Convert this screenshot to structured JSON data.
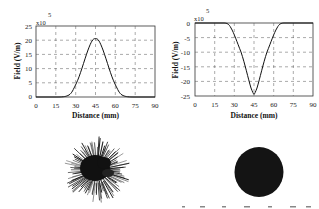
{
  "chart_data": [
    {
      "type": "line",
      "title": "",
      "xlabel": "Distance (mm)",
      "ylabel": "Field (V/m)",
      "y_multiplier": "x10^5",
      "xlim": [
        0,
        90
      ],
      "ylim": [
        0,
        25
      ],
      "xticks": [
        0,
        15,
        30,
        45,
        60,
        75,
        90
      ],
      "yticks": [
        0,
        5,
        10,
        15,
        20,
        25
      ],
      "grid": true,
      "series": [
        {
          "name": "Field",
          "x": [
            0,
            15,
            20,
            25,
            30,
            35,
            40,
            45,
            50,
            55,
            60,
            65,
            70,
            75,
            90
          ],
          "values": [
            0,
            0,
            0.3,
            1.5,
            5,
            11,
            17.5,
            20.5,
            17.5,
            11,
            5,
            1.5,
            0.3,
            0,
            0
          ]
        }
      ]
    },
    {
      "type": "line",
      "title": "",
      "xlabel": "Distance (mm)",
      "ylabel": "Field (V/m)",
      "y_multiplier": "x10^5",
      "xlim": [
        0,
        90
      ],
      "ylim": [
        -25,
        0
      ],
      "xticks": [
        0,
        15,
        30,
        45,
        60,
        75,
        90
      ],
      "yticks": [
        0,
        -5,
        -10,
        -15,
        -20,
        -25
      ],
      "grid": true,
      "series": [
        {
          "name": "Field",
          "x": [
            0,
            15,
            22,
            25,
            30,
            35,
            40,
            45,
            50,
            55,
            60,
            65,
            68,
            75,
            90
          ],
          "values": [
            0,
            0,
            0,
            -0.5,
            -3.5,
            -9,
            -18,
            -24.5,
            -18,
            -9,
            -3.5,
            -0.5,
            0,
            0,
            0
          ]
        }
      ]
    }
  ],
  "left_plot": {
    "multiplier_base": "x10",
    "multiplier_exp": "5",
    "ylabel": "Field (V/m)",
    "xlabel": "Distance (mm)",
    "yticks": [
      "25",
      "20",
      "15",
      "10",
      "5",
      "0"
    ],
    "xticks": [
      "0",
      "15",
      "30",
      "45",
      "60",
      "75",
      "90"
    ]
  },
  "right_plot": {
    "multiplier_base": "x10",
    "multiplier_exp": "5",
    "ylabel": "Field (V/m)",
    "xlabel": "Distance (mm)",
    "yticks": [
      "0",
      "-5",
      "-10",
      "-15",
      "-20",
      "-25"
    ],
    "xticks": [
      "0",
      "15",
      "30",
      "45",
      "60",
      "75",
      "90"
    ]
  },
  "images": {
    "left": "spiky-discharge-pattern",
    "right": "solid-round-discharge-pattern"
  }
}
